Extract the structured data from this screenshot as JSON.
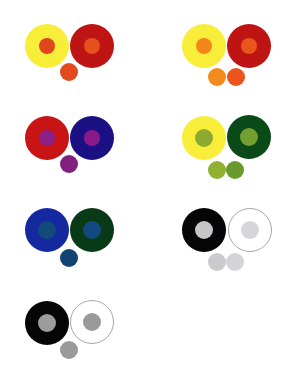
{
  "groups": [
    {
      "id": "g1",
      "left": {
        "cx": 47,
        "cy": 46,
        "r": 22,
        "ring": "#f8ee3a",
        "border": null,
        "inner": "#e0461c"
      },
      "right": {
        "cx": 92,
        "cy": 46,
        "r": 22,
        "ring": "#bf1414",
        "border": null,
        "inner": "#e6501c"
      },
      "inner_r": 8,
      "swatches": [
        {
          "cx": 69,
          "cy": 72,
          "r": 9,
          "color": "#e24a1e"
        }
      ]
    },
    {
      "id": "g2",
      "left": {
        "cx": 204,
        "cy": 46,
        "r": 22,
        "ring": "#f8ee3a",
        "border": null,
        "inner": "#f4861a"
      },
      "right": {
        "cx": 249,
        "cy": 46,
        "r": 22,
        "ring": "#bf1414",
        "border": null,
        "inner": "#e9561c"
      },
      "inner_r": 8,
      "swatches": [
        {
          "cx": 217,
          "cy": 77,
          "r": 9,
          "color": "#f38a1c"
        },
        {
          "cx": 236,
          "cy": 77,
          "r": 9,
          "color": "#eb541c"
        }
      ]
    },
    {
      "id": "g3",
      "left": {
        "cx": 47,
        "cy": 138,
        "r": 22,
        "ring": "#c81414",
        "border": null,
        "inner": "#8a2088"
      },
      "right": {
        "cx": 92,
        "cy": 138,
        "r": 22,
        "ring": "#1a1084",
        "border": null,
        "inner": "#8a1a8a"
      },
      "inner_r": 8,
      "swatches": [
        {
          "cx": 69,
          "cy": 164,
          "r": 9,
          "color": "#82207e"
        }
      ]
    },
    {
      "id": "g4",
      "left": {
        "cx": 204,
        "cy": 138,
        "r": 22,
        "ring": "#f8ee3a",
        "border": null,
        "inner": "#8caa30"
      },
      "right": {
        "cx": 249,
        "cy": 137,
        "r": 22,
        "ring": "#0a4a18",
        "border": null,
        "inner": "#72a030"
      },
      "inner_r": 9,
      "swatches": [
        {
          "cx": 217,
          "cy": 170,
          "r": 9,
          "color": "#8fb030"
        },
        {
          "cx": 235,
          "cy": 170,
          "r": 9,
          "color": "#6a9a2e"
        }
      ]
    },
    {
      "id": "g5",
      "left": {
        "cx": 47,
        "cy": 230,
        "r": 22,
        "ring": "#1428a0",
        "border": null,
        "inner": "#124a7a"
      },
      "right": {
        "cx": 92,
        "cy": 230,
        "r": 22,
        "ring": "#083a18",
        "border": null,
        "inner": "#124a80"
      },
      "inner_r": 9,
      "swatches": [
        {
          "cx": 69,
          "cy": 258,
          "r": 9,
          "color": "#124472"
        }
      ]
    },
    {
      "id": "g6",
      "left": {
        "cx": 204,
        "cy": 230,
        "r": 22,
        "ring": "#050505",
        "border": null,
        "inner": "#c6c6c8"
      },
      "right": {
        "cx": 250,
        "cy": 230,
        "r": 22,
        "ring": "#ffffff",
        "border": "#a8a8a8",
        "inner": "#d6d6da"
      },
      "inner_r": 9,
      "swatches": [
        {
          "cx": 217,
          "cy": 262,
          "r": 9,
          "color": "#cbcbcd"
        },
        {
          "cx": 235,
          "cy": 262,
          "r": 9,
          "color": "#d4d4d8"
        }
      ]
    },
    {
      "id": "g7",
      "left": {
        "cx": 47,
        "cy": 323,
        "r": 22,
        "ring": "#050505",
        "border": null,
        "inner": "#9c9c9c"
      },
      "right": {
        "cx": 92,
        "cy": 322,
        "r": 22,
        "ring": "#ffffff",
        "border": "#a8a8a8",
        "inner": "#9a9a9a"
      },
      "inner_r": 9,
      "swatches": [
        {
          "cx": 69,
          "cy": 350,
          "r": 9,
          "color": "#9a9a9a"
        }
      ]
    }
  ]
}
